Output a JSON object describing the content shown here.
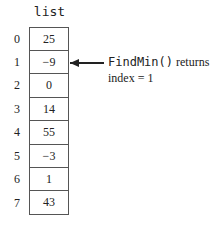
{
  "array": {
    "name": "list",
    "indices": [
      "0",
      "1",
      "2",
      "3",
      "4",
      "5",
      "6",
      "7"
    ],
    "values": [
      "25",
      "−9",
      "0",
      "14",
      "55",
      "−3",
      "1",
      "43"
    ]
  },
  "annotation": {
    "pointer_index": 1,
    "function_name": "FindMin()",
    "returns_text": "returns",
    "result_text": "index = 1"
  }
}
